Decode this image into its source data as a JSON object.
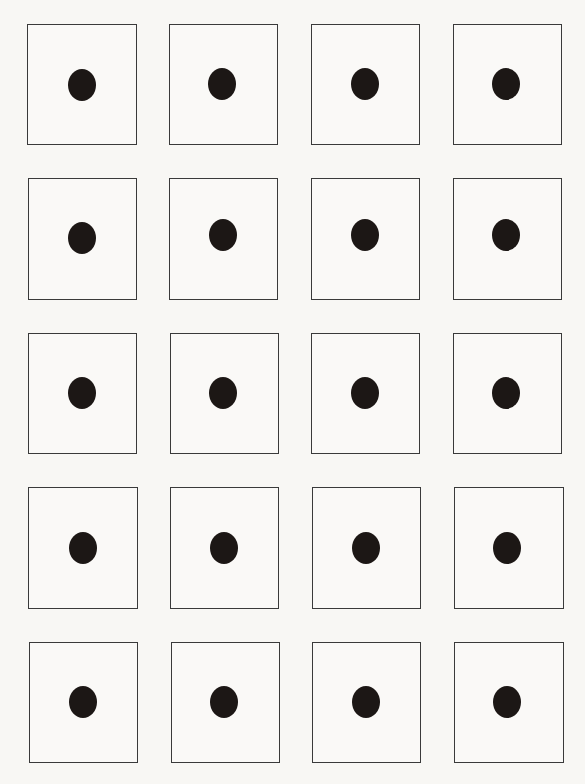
{
  "sheet": {
    "background": "#f8f7f4",
    "rows": 5,
    "columns": 4,
    "cell_border_color": "#3a3a3a",
    "dot_color": "#1c1715",
    "cells": [
      {
        "row": 1,
        "col": 1,
        "x": 27,
        "y": 24,
        "w": 110,
        "h": 121,
        "dot_x": 82,
        "dot_y": 85
      },
      {
        "row": 1,
        "col": 2,
        "x": 169,
        "y": 24,
        "w": 109,
        "h": 121,
        "dot_x": 222,
        "dot_y": 84
      },
      {
        "row": 1,
        "col": 3,
        "x": 311,
        "y": 24,
        "w": 109,
        "h": 121,
        "dot_x": 365,
        "dot_y": 84
      },
      {
        "row": 1,
        "col": 4,
        "x": 453,
        "y": 24,
        "w": 109,
        "h": 121,
        "dot_x": 506,
        "dot_y": 84
      },
      {
        "row": 2,
        "col": 1,
        "x": 28,
        "y": 178,
        "w": 109,
        "h": 122,
        "dot_x": 82,
        "dot_y": 238
      },
      {
        "row": 2,
        "col": 2,
        "x": 169,
        "y": 178,
        "w": 109,
        "h": 122,
        "dot_x": 223,
        "dot_y": 235
      },
      {
        "row": 2,
        "col": 3,
        "x": 311,
        "y": 178,
        "w": 109,
        "h": 122,
        "dot_x": 365,
        "dot_y": 235
      },
      {
        "row": 2,
        "col": 4,
        "x": 453,
        "y": 178,
        "w": 109,
        "h": 122,
        "dot_x": 506,
        "dot_y": 235
      },
      {
        "row": 3,
        "col": 1,
        "x": 28,
        "y": 333,
        "w": 109,
        "h": 121,
        "dot_x": 82,
        "dot_y": 393
      },
      {
        "row": 3,
        "col": 2,
        "x": 170,
        "y": 333,
        "w": 109,
        "h": 121,
        "dot_x": 223,
        "dot_y": 393
      },
      {
        "row": 3,
        "col": 3,
        "x": 311,
        "y": 333,
        "w": 109,
        "h": 121,
        "dot_x": 365,
        "dot_y": 393
      },
      {
        "row": 3,
        "col": 4,
        "x": 453,
        "y": 333,
        "w": 109,
        "h": 121,
        "dot_x": 506,
        "dot_y": 393
      },
      {
        "row": 4,
        "col": 1,
        "x": 28,
        "y": 487,
        "w": 110,
        "h": 122,
        "dot_x": 83,
        "dot_y": 548
      },
      {
        "row": 4,
        "col": 2,
        "x": 170,
        "y": 487,
        "w": 109,
        "h": 122,
        "dot_x": 224,
        "dot_y": 548
      },
      {
        "row": 4,
        "col": 3,
        "x": 312,
        "y": 487,
        "w": 109,
        "h": 122,
        "dot_x": 366,
        "dot_y": 548
      },
      {
        "row": 4,
        "col": 4,
        "x": 454,
        "y": 487,
        "w": 110,
        "h": 122,
        "dot_x": 507,
        "dot_y": 548
      },
      {
        "row": 5,
        "col": 1,
        "x": 29,
        "y": 642,
        "w": 109,
        "h": 121,
        "dot_x": 83,
        "dot_y": 702
      },
      {
        "row": 5,
        "col": 2,
        "x": 171,
        "y": 642,
        "w": 109,
        "h": 121,
        "dot_x": 224,
        "dot_y": 702
      },
      {
        "row": 5,
        "col": 3,
        "x": 312,
        "y": 642,
        "w": 109,
        "h": 121,
        "dot_x": 366,
        "dot_y": 702
      },
      {
        "row": 5,
        "col": 4,
        "x": 454,
        "y": 642,
        "w": 110,
        "h": 121,
        "dot_x": 507,
        "dot_y": 702
      }
    ]
  }
}
